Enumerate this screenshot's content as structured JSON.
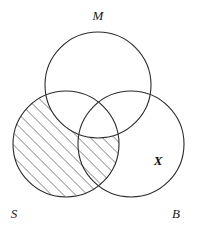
{
  "figure": {
    "title_text": "",
    "type": "venn-diagram",
    "background_color": "#ffffff",
    "stroke_color": "#2b2b2b",
    "width": 197,
    "height": 229
  },
  "sets": [
    {
      "id": "M",
      "label": "M",
      "cx": 98,
      "cy": 85,
      "r": 53,
      "label_x": 98,
      "label_y": 20,
      "shaded": false
    },
    {
      "id": "S",
      "label": "S",
      "cx": 66,
      "cy": 144,
      "r": 53,
      "label_x": 14,
      "label_y": 218,
      "shaded": true
    },
    {
      "id": "B",
      "label": "B",
      "cx": 131,
      "cy": 144,
      "r": 53,
      "label_x": 176,
      "label_y": 218,
      "shaded": false
    }
  ],
  "shading": {
    "region_description": "S minus M",
    "pattern": "diagonal-hatch",
    "angle_degrees": 45,
    "spacing_px": 6,
    "line_color": "#2b2b2b"
  },
  "marks": [
    {
      "id": "x-mark",
      "label": "X",
      "x": 158,
      "y": 165,
      "region_description": "B only"
    }
  ]
}
